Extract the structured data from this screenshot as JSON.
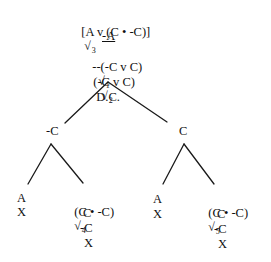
{
  "diagram": {
    "type": "truth-tree",
    "trunk": [
      {
        "formula": "[A v (C • -C)]",
        "check": "√",
        "check_index": "3",
        "annotation": "",
        "underlined": false
      },
      {
        "formula": "-A",
        "check": "",
        "check_index": "",
        "annotation": "",
        "underlined": true
      },
      {
        "formula": "--(-C v C)",
        "check": "√",
        "check_index": "1",
        "annotation": "D.C.",
        "underlined": false
      },
      {
        "formula": "(-C v C)",
        "check": "√",
        "check_index": "2",
        "annotation": "",
        "underlined": false
      }
    ],
    "branches": [
      {
        "label": "-C",
        "children": [
          {
            "lines": [
              "A",
              "X"
            ]
          },
          {
            "head": {
              "formula": "(C • -C)",
              "check": "√",
              "check_index": "4"
            },
            "lines": [
              "C",
              "-C",
              "X"
            ]
          }
        ]
      },
      {
        "label": "C",
        "children": [
          {
            "lines": [
              "A",
              "X"
            ]
          },
          {
            "head": {
              "formula": "(C • -C)",
              "check": "√",
              "check_index": "5"
            },
            "lines": [
              "C",
              "-C",
              "X"
            ]
          }
        ]
      }
    ],
    "line_color": "#1a1a1a"
  }
}
